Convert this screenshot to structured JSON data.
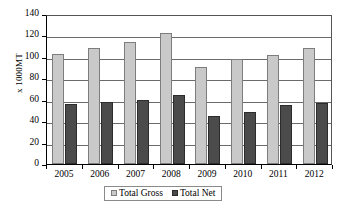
{
  "chart_data": {
    "type": "bar",
    "title": "",
    "xlabel": "",
    "ylabel": "x 1000MT",
    "ylim": [
      0,
      140
    ],
    "yticks": [
      0,
      20,
      40,
      60,
      80,
      100,
      120,
      140
    ],
    "grid": true,
    "legend_position": "bottom",
    "categories": [
      "2005",
      "2006",
      "2007",
      "2008",
      "2009",
      "2010",
      "2011",
      "2012"
    ],
    "series": [
      {
        "name": "Total Gross",
        "color": "#c9c9c9",
        "values": [
          102.5,
          108.5,
          113.5,
          122.0,
          90.5,
          98.0,
          102.0,
          108.0
        ]
      },
      {
        "name": "Total Net",
        "color": "#4b4b4b",
        "values": [
          56.0,
          58.0,
          59.5,
          64.5,
          45.0,
          48.5,
          55.0,
          57.0
        ]
      }
    ]
  },
  "axis": {
    "y_title": "x 1000MT"
  },
  "legend": {
    "items": [
      {
        "label": "Total Gross"
      },
      {
        "label": "Total Net"
      }
    ]
  }
}
